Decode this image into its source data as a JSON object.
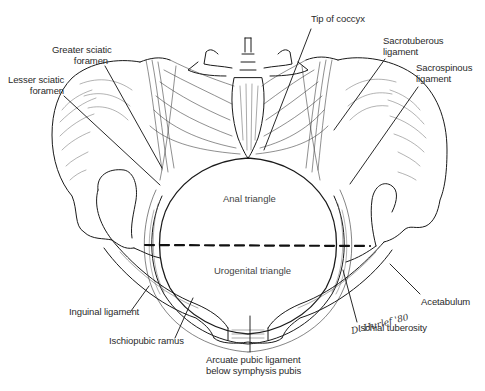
{
  "figure": {
    "signature": "D. Hurlef '80",
    "colors": {
      "line": "#1a1a1a",
      "hatch": "#555555",
      "background": "#ffffff"
    }
  },
  "labels": {
    "tip_of_coccyx": {
      "line1": "Tip of coccyx"
    },
    "greater_sciatic_foramen": {
      "line1": "Greater sciatic",
      "line2": "foramen"
    },
    "lesser_sciatic_foramen": {
      "line1": "Lesser sciatic",
      "line2": "foramen"
    },
    "sacrotuberous_ligament": {
      "line1": "Sacrotuberous",
      "line2": "ligament"
    },
    "sacrospinous_ligament": {
      "line1": "Sacrospinous",
      "line2": "ligament"
    },
    "inguinal_ligament": {
      "line1": "Inguinal ligament"
    },
    "ischiopubic_ramus": {
      "line1": "Ischiopubic ramus"
    },
    "arcuate_pubic_ligament": {
      "line1": "Arcuate pubic ligament",
      "line2": "below symphysis pubis"
    },
    "ischial_tuberosity": {
      "line1": "Ischial tuberosity"
    },
    "acetabulum": {
      "line1": "Acetabulum"
    }
  },
  "regions": {
    "anal_triangle": "Anal triangle",
    "urogenital_triangle": "Urogenital triangle"
  },
  "divider": {
    "style": "dashed",
    "description": "line between ischial tuberosities separating anal and urogenital triangles"
  }
}
